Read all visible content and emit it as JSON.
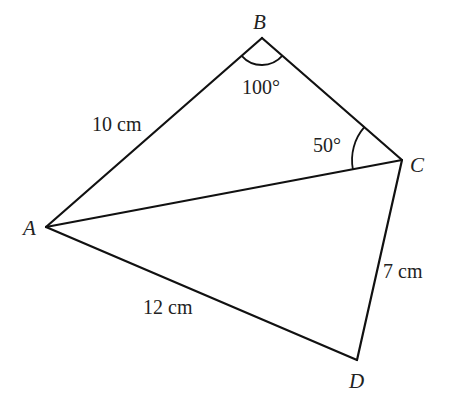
{
  "diagram": {
    "type": "quadrilateral-with-diagonal",
    "stroke_color": "#111111",
    "vertices": {
      "A": {
        "label": "A",
        "x": 46,
        "y": 227
      },
      "B": {
        "label": "B",
        "x": 262,
        "y": 38
      },
      "C": {
        "label": "C",
        "x": 402,
        "y": 160
      },
      "D": {
        "label": "D",
        "x": 357,
        "y": 360
      }
    },
    "sides": {
      "AB": {
        "label": "10 cm"
      },
      "AD": {
        "label": "12 cm"
      },
      "CD": {
        "label": "7 cm"
      },
      "AC": {
        "label": ""
      },
      "BC": {
        "label": ""
      }
    },
    "angles": {
      "ABC": {
        "label": "100°",
        "vertex": "B"
      },
      "BCA": {
        "label": "50°",
        "vertex": "C"
      }
    }
  }
}
